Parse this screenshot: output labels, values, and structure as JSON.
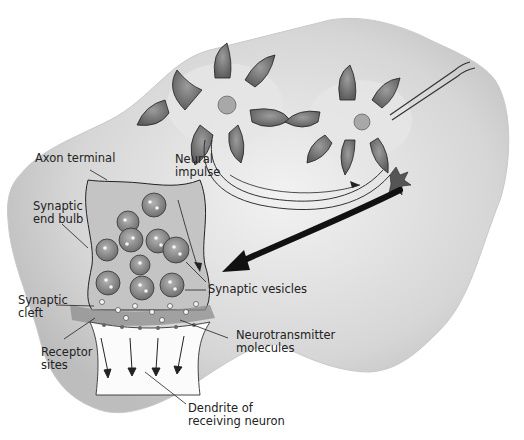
{
  "diagram": {
    "labels": {
      "axon_terminal": "Axon terminal",
      "neural_impulse": "Neural\nimpulse",
      "synaptic_end_bulb": "Synaptic\nend bulb",
      "synaptic_vesicles": "Synaptic vesicles",
      "synaptic_cleft": "Synaptic\ncleft",
      "neurotransmitter_molecules": "Neurotransmitter\nmolecules",
      "receptor_sites": "Receptor\nsites",
      "dendrite": "Dendrite of\nreceiving neuron"
    },
    "colors": {
      "background": "#ffffff",
      "wash": "#d9d9d9",
      "wash_dark": "#9a9a9a",
      "ink": "#1e1e1e",
      "vesicle": "#8a8a8a"
    }
  }
}
